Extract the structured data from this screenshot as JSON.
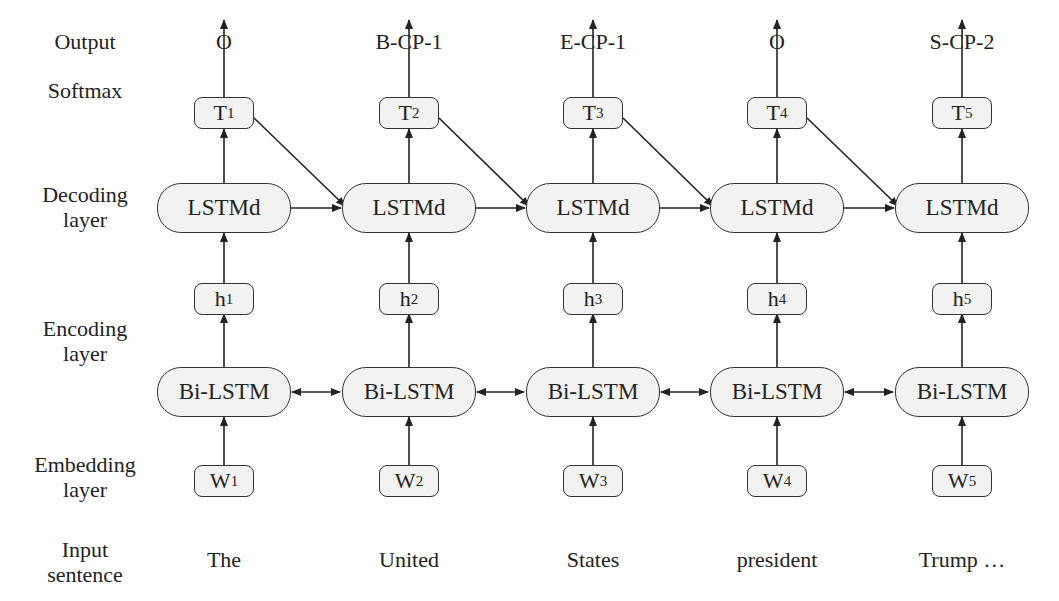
{
  "row_labels": {
    "output": "Output",
    "softmax": "Softmax",
    "decoding_1": "Decoding",
    "decoding_2": "layer",
    "encoding_1": "Encoding",
    "encoding_2": "layer",
    "embedding_1": "Embedding",
    "embedding_2": "layer",
    "input_1": "Input",
    "input_2": "sentence"
  },
  "columns": [
    {
      "output": "O",
      "tag": "T",
      "tag_sub": "1",
      "decoder": "LSTMd",
      "hidden": "h",
      "hidden_sub": "1",
      "encoder": "Bi-LSTM",
      "word": "W",
      "word_sub": "1",
      "input": "The"
    },
    {
      "output": "B-CP-1",
      "tag": "T",
      "tag_sub": "2",
      "decoder": "LSTMd",
      "hidden": "h",
      "hidden_sub": "2",
      "encoder": "Bi-LSTM",
      "word": "W",
      "word_sub": "2",
      "input": "United"
    },
    {
      "output": "E-CP-1",
      "tag": "T",
      "tag_sub": "3",
      "decoder": "LSTMd",
      "hidden": "h",
      "hidden_sub": "3",
      "encoder": "Bi-LSTM",
      "word": "W",
      "word_sub": "3",
      "input": "States"
    },
    {
      "output": "O",
      "tag": "T",
      "tag_sub": "4",
      "decoder": "LSTMd",
      "hidden": "h",
      "hidden_sub": "4",
      "encoder": "Bi-LSTM",
      "word": "W",
      "word_sub": "4",
      "input": "president"
    },
    {
      "output": "S-CP-2",
      "tag": "T",
      "tag_sub": "5",
      "decoder": "LSTMd",
      "hidden": "h",
      "hidden_sub": "5",
      "encoder": "Bi-LSTM",
      "word": "W",
      "word_sub": "5",
      "input": "Trump …"
    }
  ],
  "colors": {
    "box_fill": "#f2f2f2",
    "stroke": "#333333",
    "text": "#222222"
  }
}
